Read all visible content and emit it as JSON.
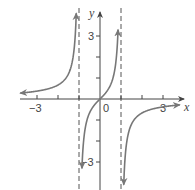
{
  "chart_data": {
    "type": "line",
    "title": "",
    "function": "f(x) = x / (1 - x^2)",
    "xlabel": "x",
    "ylabel": "y",
    "xlim": [
      -3.9,
      3.9
    ],
    "ylim": [
      -4.2,
      4.6
    ],
    "x_ticks": [
      -3,
      -2,
      -1,
      0,
      1,
      2,
      3
    ],
    "y_ticks": [
      -3,
      -2,
      -1,
      1,
      2,
      3
    ],
    "x_tick_labels": [
      {
        "value": -3,
        "text": "−3"
      },
      {
        "value": 0,
        "text": "0"
      },
      {
        "value": 3,
        "text": "3"
      }
    ],
    "y_tick_labels": [
      {
        "value": 3,
        "text": "3"
      },
      {
        "value": -3,
        "text": "−3"
      }
    ],
    "vertical_asymptotes": [
      -1,
      1
    ],
    "horizontal_asymptote": 0,
    "grid": false,
    "legend": null,
    "series": [
      {
        "name": "left branch",
        "x": [
          -3.8,
          -3,
          -2,
          -1.5,
          -1.2,
          -1.1
        ],
        "y": [
          0.28,
          0.375,
          0.667,
          1.2,
          2.73,
          5.24
        ]
      },
      {
        "name": "middle branch",
        "x": [
          -0.95,
          -0.8,
          -0.5,
          0,
          0.5,
          0.8,
          0.95
        ],
        "y": [
          -9.74,
          -2.22,
          -0.667,
          0,
          0.667,
          2.22,
          9.74
        ]
      },
      {
        "name": "right branch",
        "x": [
          1.1,
          1.2,
          1.5,
          2,
          3,
          3.8
        ],
        "y": [
          -5.24,
          -2.73,
          -1.2,
          -0.667,
          -0.375,
          -0.28
        ]
      }
    ],
    "colors": {
      "curve": "#777777",
      "axis": "#444444",
      "asymptote": "#555555"
    }
  },
  "labels": {
    "x_axis": "x",
    "y_axis": "y",
    "origin": "0",
    "x_neg3": "−3",
    "x_pos3": "3",
    "y_pos3": "3",
    "y_neg3": "−3"
  }
}
